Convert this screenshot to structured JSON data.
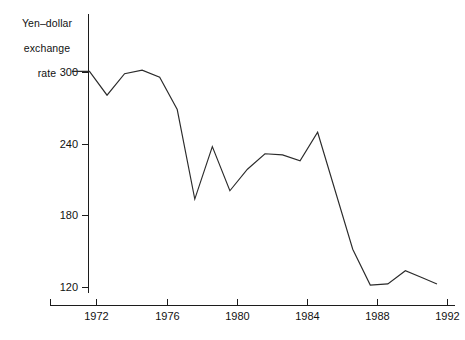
{
  "chart_data": {
    "type": "line",
    "title": "",
    "ylabel": "Yen–dollar\nexchange\nrate",
    "xlabel": "",
    "xlim": [
      1970.5,
      1992.0
    ],
    "ylim": [
      108,
      312
    ],
    "grid": false,
    "legend": "none",
    "yticks": [
      120,
      180,
      240,
      300
    ],
    "xticks": [
      1972,
      1976,
      1980,
      1984,
      1988,
      1992
    ],
    "x": [
      1970.6,
      1971.6,
      1972.6,
      1973.6,
      1974.6,
      1975.6,
      1976.6,
      1977.6,
      1978.6,
      1979.6,
      1980.6,
      1981.6,
      1982.6,
      1983.6,
      1984.6,
      1985.6,
      1986.6,
      1987.6,
      1988.6,
      1989.6,
      1990.6,
      1991.4
    ],
    "values": [
      301,
      301,
      281,
      299,
      302,
      296,
      269,
      194,
      238,
      201,
      219,
      232,
      231,
      226,
      250,
      201,
      152,
      122,
      123,
      134,
      128,
      123
    ],
    "series": [
      {
        "name": "Yen per U.S. dollar",
        "values": [
          301,
          301,
          281,
          299,
          302,
          296,
          269,
          194,
          238,
          201,
          219,
          232,
          231,
          226,
          250,
          201,
          152,
          122,
          123,
          134,
          128,
          123
        ]
      }
    ],
    "annotations": []
  },
  "axis": {
    "y_title_line1": "Yen–dollar",
    "y_title_line2": "exchange",
    "y_title_line3": "rate",
    "y_labels": [
      "300",
      "240",
      "180",
      "120"
    ],
    "x_labels": [
      "1972",
      "1976",
      "1980",
      "1984",
      "1988",
      "1992"
    ]
  },
  "colors": {
    "line": "#2b2b2b",
    "axis": "#1c1c1c",
    "text": "#111111",
    "background": "#ffffff"
  }
}
